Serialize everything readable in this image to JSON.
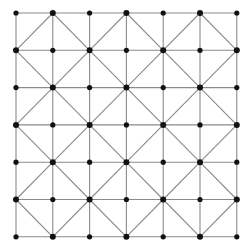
{
  "diagram": {
    "type": "lattice-grid",
    "cols": 7,
    "rows": 7,
    "x_positions": [
      16,
      52.8,
      89.6,
      126.4,
      163.2,
      200,
      236.8
    ],
    "y_positions": [
      13,
      50.3,
      87.6,
      124.9,
      162.2,
      199.5,
      236.8
    ],
    "diagonal_rule": "each cell diagonal connects the two corners where (col+row) is odd",
    "node_radius": 2.6,
    "colors": {
      "line": "#8a8a8a",
      "node": "#111111",
      "background": "#ffffff"
    }
  }
}
